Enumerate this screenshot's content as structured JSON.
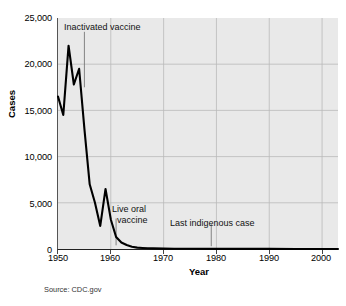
{
  "chart_data": {
    "type": "line",
    "title": "",
    "xlabel": "Year",
    "ylabel": "Cases",
    "xlim": [
      1950,
      2003
    ],
    "ylim": [
      0,
      25000
    ],
    "grid": true,
    "legend": null,
    "source": "Source: CDC.gov",
    "x_ticks": [
      "1950",
      "1960",
      "1970",
      "1980",
      "1990",
      "2000"
    ],
    "x_tick_values": [
      1950,
      1960,
      1970,
      1980,
      1990,
      2000
    ],
    "y_ticks": [
      "0",
      "5,000",
      "10,000",
      "15,000",
      "20,000",
      "25,000"
    ],
    "y_tick_values": [
      0,
      5000,
      10000,
      15000,
      20000,
      25000
    ],
    "series": [
      {
        "name": "Polio cases",
        "color": "#000000",
        "x": [
          1950,
          1951,
          1952,
          1953,
          1954,
          1955,
          1956,
          1957,
          1958,
          1959,
          1960,
          1961,
          1962,
          1963,
          1964,
          1965,
          1966,
          1967,
          1968,
          1970,
          1972,
          1975,
          1980,
          1985,
          1990,
          1995,
          2000,
          2003
        ],
        "values": [
          16500,
          14500,
          22000,
          17800,
          19500,
          13000,
          7000,
          5000,
          2500,
          6500,
          3200,
          1300,
          700,
          430,
          250,
          150,
          110,
          80,
          60,
          40,
          30,
          20,
          15,
          10,
          8,
          5,
          4,
          3
        ]
      }
    ],
    "annotations": [
      {
        "id": "inactivated",
        "text_line1": "Inactivated vaccine",
        "text_line2": "",
        "x_value": 1955,
        "leader_from_y": 23500,
        "leader_to_y": 17500
      },
      {
        "id": "live-oral",
        "text_line1": "Live oral",
        "text_line2": "vaccine",
        "x_value": 1961,
        "leader_from_y": 3300,
        "leader_to_y": 400
      },
      {
        "id": "last-indigenous",
        "text_line1": "Last indigenous case",
        "text_line2": "",
        "x_value": 1979,
        "leader_from_y": 2700,
        "leader_to_y": 300
      }
    ]
  }
}
